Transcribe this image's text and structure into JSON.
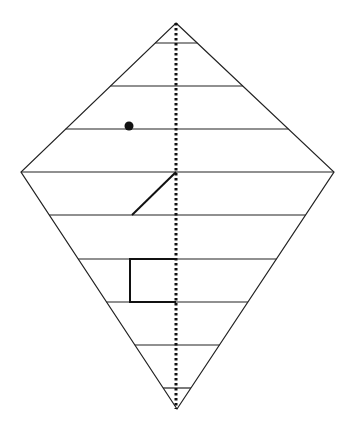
{
  "diagram": {
    "type": "kite-with-horizontal-bands",
    "kite": {
      "top": [
        176,
        23
      ],
      "left": [
        21,
        172
      ],
      "right": [
        334,
        172
      ],
      "bottom": [
        177,
        409
      ],
      "stroke": "#222222"
    },
    "axis": {
      "style": "dotted",
      "x": 176,
      "y1": 23,
      "y2": 409,
      "stroke": "#111111"
    },
    "horizontal_lines_y": [
      43,
      86,
      129,
      172,
      215,
      259,
      302,
      345,
      388
    ],
    "dot": {
      "cx": 129,
      "cy": 126,
      "r": 4.5,
      "fill": "#111111"
    },
    "diagonal_segment": {
      "x1": 176,
      "y1": 172,
      "x2": 132,
      "y2": 215,
      "stroke": "#111111"
    },
    "rectangle": {
      "x": 130,
      "y": 259,
      "width": 46,
      "height": 43,
      "stroke": "#111111"
    }
  }
}
